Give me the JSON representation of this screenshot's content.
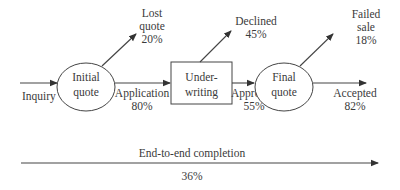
{
  "diagram": {
    "type": "process-funnel",
    "nodes": [
      {
        "id": "initial_quote",
        "shape": "ellipse",
        "lines": [
          "Initial",
          "quote"
        ]
      },
      {
        "id": "underwriting",
        "shape": "rectangle",
        "lines": [
          "Under-",
          "writing"
        ]
      },
      {
        "id": "final_quote",
        "shape": "ellipse",
        "lines": [
          "Final",
          "quote"
        ]
      }
    ],
    "flows": {
      "inquiry": {
        "label": "Inquiry"
      },
      "application": {
        "label": "Application",
        "value": "80%"
      },
      "approved": {
        "label": "Approved",
        "value": "55%"
      },
      "accepted": {
        "label": "Accepted",
        "value": "82%"
      }
    },
    "exits": {
      "lost_quote": {
        "lines": [
          "Lost",
          "quote"
        ],
        "value": "20%"
      },
      "declined": {
        "lines": [
          "Declined"
        ],
        "value": "45%"
      },
      "failed_sale": {
        "lines": [
          "Failed",
          "sale"
        ],
        "value": "18%"
      }
    },
    "end_to_end": {
      "label": "End-to-end completion",
      "value": "36%"
    }
  }
}
